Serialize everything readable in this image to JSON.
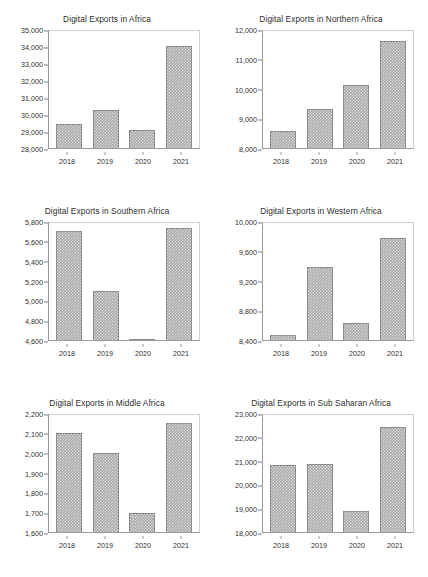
{
  "page": {
    "background_color": "#ffffff",
    "bar_color": "#a8a8a8",
    "bar_edge_color": "#8c8c8c",
    "axis_color": "#9a9a9a",
    "text_color": "#2e2e2e",
    "layout": "2 columns x 3 rows of bar charts"
  },
  "chart_data": [
    {
      "type": "bar",
      "title": "Digital Exports in Africa",
      "xlabel": "",
      "ylabel": "",
      "categories": [
        "2018",
        "2019",
        "2020",
        "2021"
      ],
      "values": [
        29400,
        30250,
        29050,
        34070
      ],
      "ylim": [
        28000,
        35000
      ],
      "ytick_step": 1000,
      "yticks": [
        "35,000",
        "34,000",
        "33,000",
        "32,000",
        "31,000",
        "30,000",
        "29,000",
        "28,000"
      ],
      "ytick_values": [
        35000,
        34000,
        33000,
        32000,
        31000,
        30000,
        29000,
        28000
      ],
      "grid": false,
      "legend": "none"
    },
    {
      "type": "bar",
      "title": "Digital Exports in Northern Africa",
      "xlabel": "",
      "ylabel": "",
      "categories": [
        "2018",
        "2019",
        "2020",
        "2021"
      ],
      "values": [
        8570,
        9310,
        10150,
        11620
      ],
      "ylim": [
        8000,
        12000
      ],
      "ytick_step": 1000,
      "yticks": [
        "12,000",
        "11,000",
        "10,000",
        "9,000",
        "8,000"
      ],
      "ytick_values": [
        12000,
        11000,
        10000,
        9000,
        8000
      ],
      "grid": false,
      "legend": "none"
    },
    {
      "type": "bar",
      "title": "Digital Exports in Southern Africa",
      "xlabel": "",
      "ylabel": "",
      "categories": [
        "2018",
        "2019",
        "2020",
        "2021"
      ],
      "values": [
        5705,
        5095,
        4615,
        5740
      ],
      "ylim": [
        4600,
        5800
      ],
      "ytick_step": 200,
      "yticks": [
        "5,800",
        "5,600",
        "5,400",
        "5,200",
        "5,000",
        "4,800",
        "4,600"
      ],
      "ytick_values": [
        5800,
        5600,
        5400,
        5200,
        5000,
        4800,
        4600
      ],
      "grid": false,
      "legend": "none"
    },
    {
      "type": "bar",
      "title": "Digital Exports in Western Africa",
      "xlabel": "",
      "ylabel": "",
      "categories": [
        "2018",
        "2019",
        "2020",
        "2021"
      ],
      "values": [
        8470,
        9390,
        8630,
        9780
      ],
      "ylim": [
        8400,
        10000
      ],
      "ytick_step": 400,
      "yticks": [
        "10,000",
        "9,600",
        "9,200",
        "8,800",
        "8,400"
      ],
      "ytick_values": [
        10000,
        9600,
        9200,
        8800,
        8400
      ],
      "grid": false,
      "legend": "none"
    },
    {
      "type": "bar",
      "title": "Digital Exports in Middle Africa",
      "xlabel": "",
      "ylabel": "",
      "categories": [
        "2018",
        "2019",
        "2020",
        "2021"
      ],
      "values": [
        2105,
        2000,
        1698,
        2155
      ],
      "ylim": [
        1600,
        2200
      ],
      "ytick_step": 100,
      "yticks": [
        "2,200",
        "2,100",
        "2,000",
        "1,900",
        "1,800",
        "1,700",
        "1,600"
      ],
      "ytick_values": [
        2200,
        2100,
        2000,
        1900,
        1800,
        1700,
        1600
      ],
      "grid": false,
      "legend": "none"
    },
    {
      "type": "bar",
      "title": "Digital Exports in Sub Saharan Africa",
      "xlabel": "",
      "ylabel": "",
      "categories": [
        "2018",
        "2019",
        "2020",
        "2021"
      ],
      "values": [
        20840,
        20900,
        18880,
        22440
      ],
      "ylim": [
        18000,
        23000
      ],
      "ytick_step": 1000,
      "yticks": [
        "23,000",
        "22,000",
        "21,000",
        "20,000",
        "19,000",
        "18,000"
      ],
      "ytick_values": [
        23000,
        22000,
        21000,
        20000,
        19000,
        18000
      ],
      "grid": false,
      "legend": "none"
    }
  ]
}
